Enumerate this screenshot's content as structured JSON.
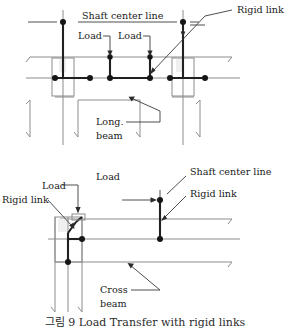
{
  "figure": {
    "caption": "그림 9 Load Transfer with rigid links",
    "title_visible_portion": "Load Transfer with rigid links"
  },
  "colors": {
    "background": "#ffffff",
    "thin_line": "#8c8c8c",
    "heavy_line": "#202020",
    "node": "#151515",
    "leader": "#3a3a3a",
    "text": "#1a1a1a"
  },
  "top_diagram": {
    "name": "longitudinal-beam-load-transfer",
    "labels": {
      "shaft_center_line": "Shaft center line",
      "rigid_link": "Rigid link",
      "load_left": "Load",
      "load_right": "Load",
      "long_beam_line1": "Long.",
      "long_beam_line2": "beam"
    }
  },
  "bottom_diagram": {
    "name": "cross-beam-load-transfer",
    "labels": {
      "shaft_center_line": "Shaft center line",
      "rigid_link_right": "Rigid link",
      "rigid_link_left": "Rigid link",
      "load_right": "Load",
      "load_left": "Load",
      "cross_beam_line1": "Cross",
      "cross_beam_line2": "beam"
    }
  }
}
